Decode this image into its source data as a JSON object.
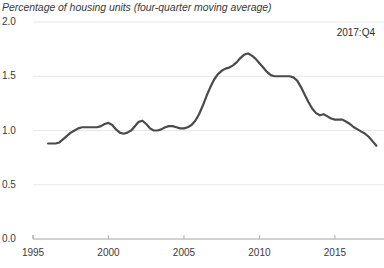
{
  "chart_data": {
    "type": "line",
    "title": "Percentage of housing units (four-quarter moving average)",
    "xlabel": "",
    "ylabel": "",
    "ylim": [
      0.0,
      2.0
    ],
    "xlim": [
      1995,
      2018.25
    ],
    "grid": true,
    "legend": false,
    "annotations": [
      {
        "text": "2017:Q4",
        "x": 2017.75,
        "y": 1.92
      }
    ],
    "ytick_labels": [
      "0.0",
      "0.5",
      "1.0",
      "1.5",
      "2.0"
    ],
    "ytick_values": [
      0.0,
      0.5,
      1.0,
      1.5,
      2.0
    ],
    "xtick_labels": [
      "1995",
      "2000",
      "2005",
      "2010",
      "2015"
    ],
    "xtick_values": [
      1995,
      2000,
      2005,
      2010,
      2015
    ],
    "line_color": "#4a4a4a",
    "grid_color": "#e8e8e8",
    "axis_color": "#b0b0b0",
    "series": [
      {
        "name": "Percentage of housing units",
        "x": [
          1996.0,
          1996.25,
          1996.5,
          1996.75,
          1997.0,
          1997.25,
          1997.5,
          1997.75,
          1998.0,
          1998.25,
          1998.5,
          1998.75,
          1999.0,
          1999.25,
          1999.5,
          1999.75,
          2000.0,
          2000.25,
          2000.5,
          2000.75,
          2001.0,
          2001.25,
          2001.5,
          2001.75,
          2002.0,
          2002.25,
          2002.5,
          2002.75,
          2003.0,
          2003.25,
          2003.5,
          2003.75,
          2004.0,
          2004.25,
          2004.5,
          2004.75,
          2005.0,
          2005.25,
          2005.5,
          2005.75,
          2006.0,
          2006.25,
          2006.5,
          2006.75,
          2007.0,
          2007.25,
          2007.5,
          2007.75,
          2008.0,
          2008.25,
          2008.5,
          2008.75,
          2009.0,
          2009.25,
          2009.5,
          2009.75,
          2010.0,
          2010.25,
          2010.5,
          2010.75,
          2011.0,
          2011.25,
          2011.5,
          2011.75,
          2012.0,
          2012.25,
          2012.5,
          2012.75,
          2013.0,
          2013.25,
          2013.5,
          2013.75,
          2014.0,
          2014.25,
          2014.5,
          2014.75,
          2015.0,
          2015.25,
          2015.5,
          2015.75,
          2016.0,
          2016.25,
          2016.5,
          2016.75,
          2017.0,
          2017.25,
          2017.5,
          2017.75
        ],
        "values": [
          0.88,
          0.88,
          0.88,
          0.89,
          0.92,
          0.95,
          0.98,
          1.0,
          1.02,
          1.03,
          1.03,
          1.03,
          1.03,
          1.03,
          1.04,
          1.06,
          1.07,
          1.05,
          1.01,
          0.98,
          0.97,
          0.98,
          1.0,
          1.04,
          1.08,
          1.09,
          1.06,
          1.02,
          1.0,
          1.0,
          1.01,
          1.03,
          1.04,
          1.04,
          1.03,
          1.02,
          1.02,
          1.03,
          1.05,
          1.09,
          1.15,
          1.23,
          1.32,
          1.4,
          1.47,
          1.52,
          1.55,
          1.57,
          1.58,
          1.6,
          1.63,
          1.67,
          1.7,
          1.71,
          1.69,
          1.66,
          1.62,
          1.58,
          1.54,
          1.51,
          1.5,
          1.5,
          1.5,
          1.5,
          1.5,
          1.49,
          1.46,
          1.4,
          1.33,
          1.26,
          1.2,
          1.16,
          1.14,
          1.15,
          1.13,
          1.11,
          1.1,
          1.1,
          1.1,
          1.08,
          1.06,
          1.03,
          1.01,
          0.99,
          0.97,
          0.94,
          0.9,
          0.86
        ]
      }
    ]
  }
}
